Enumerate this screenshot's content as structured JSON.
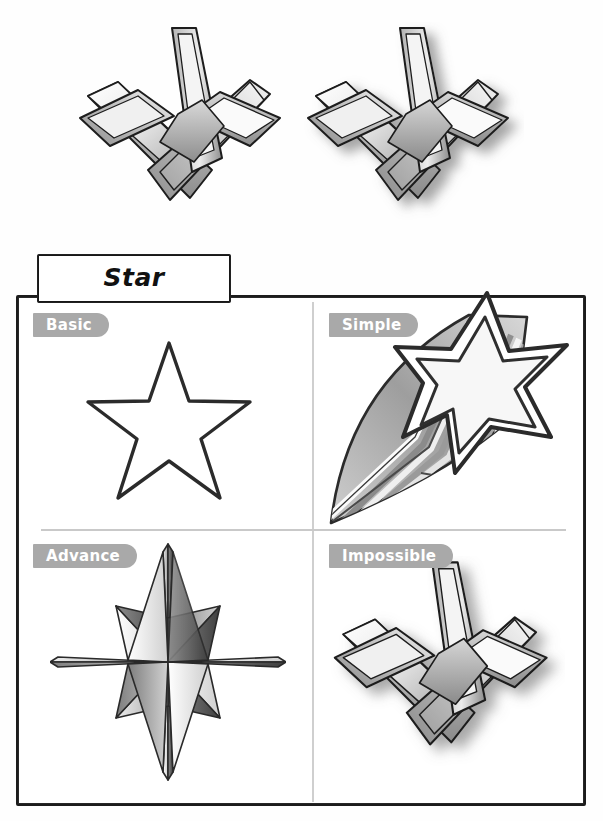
{
  "sheet": {
    "title": "Star",
    "specimens": [
      {
        "name": "impossible-star-plain",
        "caption": ""
      },
      {
        "name": "impossible-star-shadow",
        "caption": ""
      }
    ],
    "quadrants": [
      {
        "id": "basic",
        "label": "Basic",
        "artwork": "five-point-star-outline"
      },
      {
        "id": "simple",
        "label": "Simple",
        "artwork": "shooting-star-with-striped-trail"
      },
      {
        "id": "advance",
        "label": "Advance",
        "artwork": "eight-point-compass-rose-star"
      },
      {
        "id": "impossible",
        "label": "Impossible",
        "artwork": "impossible-interlocking-star"
      }
    ]
  },
  "colors": {
    "tag_background": "#a9a9a9",
    "tag_text": "#ffffff",
    "panel_border": "#1c1c1c",
    "divider": "#cccccc",
    "ink": "#1a1a1a",
    "paper": "#ffffff"
  }
}
